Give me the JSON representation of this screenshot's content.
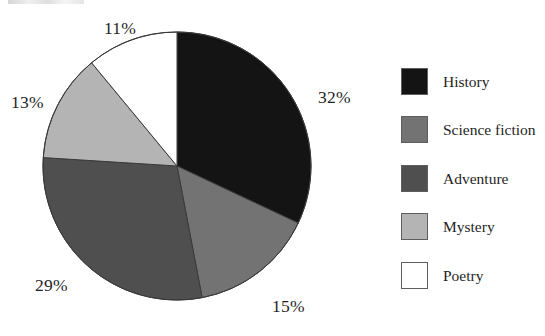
{
  "chart_data": {
    "type": "pie",
    "title": "",
    "categories": [
      "History",
      "Science fiction",
      "Adventure",
      "Mystery",
      "Poetry"
    ],
    "values": [
      32,
      15,
      29,
      13,
      11
    ],
    "value_unit": "%",
    "data_labels": [
      "32%",
      "15%",
      "29%",
      "13%",
      "11%"
    ],
    "colors": [
      "#141414",
      "#737373",
      "#4f4f4f",
      "#b4b4b4",
      "#ffffff"
    ],
    "slice_order": "clockwise",
    "start_angle_deg": 0,
    "legend_position": "right",
    "grid": false,
    "xlabel": "",
    "ylabel": "",
    "slices": [
      {
        "label": "History",
        "value": 32,
        "data_label": "32%",
        "color": "#141414"
      },
      {
        "label": "Science fiction",
        "value": 15,
        "data_label": "15%",
        "color": "#737373"
      },
      {
        "label": "Adventure",
        "value": 29,
        "data_label": "29%",
        "color": "#4f4f4f"
      },
      {
        "label": "Mystery",
        "value": 13,
        "data_label": "13%",
        "color": "#b4b4b4"
      },
      {
        "label": "Poetry",
        "value": 11,
        "data_label": "11%",
        "color": "#ffffff"
      }
    ]
  },
  "labels": {
    "history_pct": "32%",
    "sciencefiction_pct": "15%",
    "adventure_pct": "29%",
    "mystery_pct": "13%",
    "poetry_pct": "11%"
  },
  "legend": {
    "items": [
      {
        "label": "History",
        "color": "#141414"
      },
      {
        "label": "Science fiction",
        "color": "#737373"
      },
      {
        "label": "Adventure",
        "color": "#4f4f4f"
      },
      {
        "label": "Mystery",
        "color": "#b4b4b4"
      },
      {
        "label": "Poetry",
        "color": "#ffffff"
      }
    ]
  },
  "style": {
    "background": "#ffffff",
    "text_color": "#1f1f1f",
    "slice_outline": "#3a3a3a"
  }
}
